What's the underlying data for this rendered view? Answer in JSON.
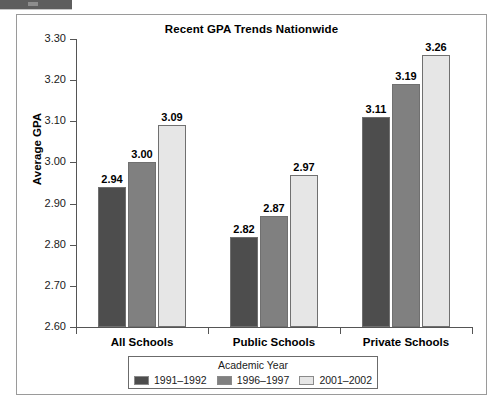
{
  "figure": {
    "title": "Recent GPA Trends Nationwide"
  },
  "chart_data": {
    "type": "bar",
    "title": "Recent GPA Trends Nationwide",
    "xlabel": "",
    "ylabel": "Average GPA",
    "ylim": [
      2.6,
      3.3
    ],
    "ytick_labels": [
      "2.60",
      "2.70",
      "2.80",
      "2.90",
      "3.00",
      "3.10",
      "3.20",
      "3.30"
    ],
    "ytick_values": [
      2.6,
      2.7,
      2.8,
      2.9,
      3.0,
      3.1,
      3.2,
      3.3
    ],
    "grid": false,
    "legend_position": "bottom",
    "legend_title": "Academic Year",
    "categories": [
      "All Schools",
      "Public Schools",
      "Private Schools"
    ],
    "series": [
      {
        "name": "1991–1992",
        "color": "#4d4d4d",
        "values": [
          2.94,
          2.82,
          3.11
        ],
        "labels": [
          "2.94",
          "2.82",
          "3.11"
        ]
      },
      {
        "name": "1996–1997",
        "color": "#808080",
        "values": [
          3.0,
          2.87,
          3.19
        ],
        "labels": [
          "3.00",
          "2.87",
          "3.19"
        ]
      },
      {
        "name": "2001–2002",
        "color": "#e6e6e6",
        "values": [
          3.09,
          2.97,
          3.26
        ],
        "labels": [
          "3.09",
          "2.97",
          "3.26"
        ]
      }
    ]
  }
}
